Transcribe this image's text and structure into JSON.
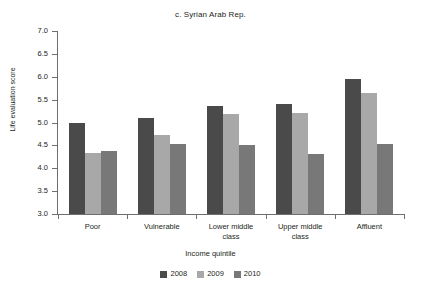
{
  "chart_data": {
    "type": "bar",
    "title": "c. Syrian Arab Rep.",
    "xlabel": "Income quintile",
    "ylabel": "Life evaluation score",
    "ylim": [
      3.0,
      7.0
    ],
    "ytick_step": 0.5,
    "yticks": [
      "7.0",
      "6.5",
      "6.0",
      "5.5",
      "5.0",
      "4.5",
      "4.0",
      "3.5",
      "3.0"
    ],
    "ytick_values": [
      7.0,
      6.5,
      6.0,
      5.5,
      5.0,
      4.5,
      4.0,
      3.5,
      3.0
    ],
    "grid": false,
    "legend_position": "bottom",
    "categories": [
      "Poor",
      "Vulnerable",
      "Lower middle class",
      "Upper middle class",
      "Affluent"
    ],
    "category_lines": [
      [
        "Poor"
      ],
      [
        "Vulnerable"
      ],
      [
        "Lower middle",
        "class"
      ],
      [
        "Upper middle",
        "class"
      ],
      [
        "Affluent"
      ]
    ],
    "series": [
      {
        "name": "2008",
        "color": "#4a4a4a",
        "values": [
          5.0,
          5.09,
          5.37,
          5.4,
          5.95
        ]
      },
      {
        "name": "2009",
        "color": "#a8a8a8",
        "values": [
          4.33,
          4.72,
          5.19,
          5.21,
          5.65
        ]
      },
      {
        "name": "2010",
        "color": "#787878",
        "values": [
          4.37,
          4.53,
          4.51,
          4.31,
          4.54
        ]
      }
    ]
  },
  "axis": {
    "line_color": "#6f6f6f"
  }
}
